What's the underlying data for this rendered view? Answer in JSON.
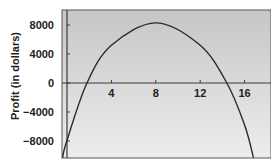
{
  "chart_data": {
    "type": "line",
    "title": "",
    "xlabel": "",
    "ylabel": "Profit (in dollars)",
    "xlim": [
      -0.5,
      18
    ],
    "ylim": [
      -10300,
      10000
    ],
    "x_ticks": [
      4,
      8,
      12,
      16
    ],
    "x_tick_labels": [
      "4",
      "8",
      "12",
      "16"
    ],
    "y_ticks": [
      8000,
      4000,
      0,
      -4000,
      -8000
    ],
    "y_tick_labels": [
      "8000",
      "4000",
      "0",
      "−4000",
      "−8000"
    ],
    "grid": false,
    "legend": null,
    "series": [
      {
        "name": "Profit",
        "x": [
          -0.4,
          0,
          1.8,
          4,
          8,
          12,
          14.4,
          16,
          16.8
        ],
        "values": [
          -10300,
          -7900,
          0,
          5200,
          8300,
          5200,
          0,
          -5800,
          -10300
        ]
      }
    ]
  },
  "colors": {
    "plot_bg_top": "#c4c4c4",
    "plot_bg_bottom": "#ececec",
    "axis": "#3a3a3a",
    "curve": "#2a2a2a",
    "text": "#222222"
  }
}
